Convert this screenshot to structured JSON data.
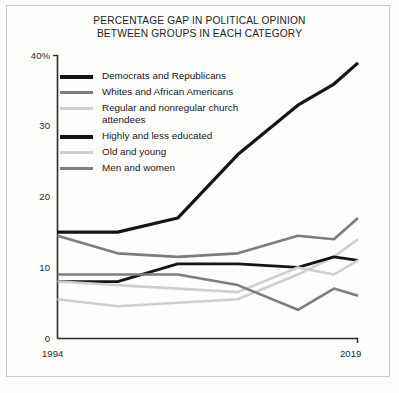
{
  "chart_data": {
    "type": "line",
    "title": "PERCENTAGE GAP IN POLITICAL OPINION BETWEEN GROUPS IN EACH CATEGORY",
    "title_lines": [
      "PERCENTAGE GAP IN POLITICAL OPINION",
      "BETWEEN GROUPS IN EACH CATEGORY"
    ],
    "xlabel": "",
    "ylabel": "",
    "xlim": [
      1994,
      2019
    ],
    "ylim": [
      0,
      40
    ],
    "grid": false,
    "legend_position": "upper-left-inside",
    "x_tick_labels": [
      "1994",
      "2019"
    ],
    "y_tick_labels": [
      "0",
      "10",
      "20",
      "30",
      "40%"
    ],
    "y_ticks": [
      0,
      10,
      20,
      30,
      40
    ],
    "x": [
      1994,
      1999,
      2004,
      2009,
      2014,
      2017,
      2019
    ],
    "series": [
      {
        "name": "Democrats and Republicans",
        "color": "#141414",
        "width": 3.2,
        "values": [
          15,
          15,
          17,
          26,
          33,
          36,
          39
        ]
      },
      {
        "name": "Whites and African Americans",
        "color": "#7d7d7d",
        "width": 2.6,
        "values": [
          14.5,
          12,
          11.5,
          12,
          14.5,
          14,
          17
        ]
      },
      {
        "name": "Regular and nonregular church attendees",
        "color": "#cfcfcf",
        "width": 2.6,
        "values": [
          5.5,
          4.5,
          5,
          5.5,
          9,
          11.5,
          14
        ]
      },
      {
        "name": "Highly and less educated",
        "color": "#141414",
        "width": 2.8,
        "values": [
          8,
          8,
          10.5,
          10.5,
          10,
          11.5,
          11
        ]
      },
      {
        "name": "Old and young",
        "color": "#cfcfcf",
        "width": 2.6,
        "values": [
          8,
          7.5,
          7,
          6.5,
          10,
          9,
          11
        ]
      },
      {
        "name": "Men and women",
        "color": "#7d7d7d",
        "width": 2.6,
        "values": [
          9,
          9,
          9,
          7.5,
          4,
          7,
          6
        ]
      }
    ]
  },
  "legend": {
    "items": [
      {
        "label": "Democrats and Republicans",
        "color": "#141414"
      },
      {
        "label": "Whites and African Americans",
        "color": "#7d7d7d"
      },
      {
        "label": "Regular and nonregular church\nattendees",
        "color": "#cfcfcf"
      },
      {
        "label": "Highly and less educated",
        "color": "#141414"
      },
      {
        "label": "Old and young",
        "color": "#cfcfcf"
      },
      {
        "label": "Men and women",
        "color": "#7d7d7d"
      }
    ]
  },
  "axes": {
    "y_labels": [
      "40%",
      "30",
      "20",
      "10",
      "0"
    ],
    "x_labels": [
      "1994",
      "2019"
    ]
  }
}
